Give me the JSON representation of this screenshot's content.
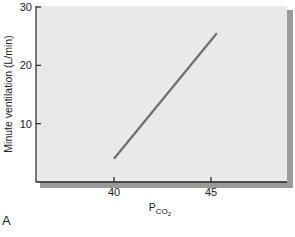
{
  "chart_data": {
    "type": "line",
    "title": "",
    "xlabel": "P_CO2",
    "xlabel_main": "P",
    "xlabel_sub": "CO",
    "xlabel_subsub": "2",
    "ylabel": "Minute ventilation (L/min)",
    "xlim": [
      37.8,
      48.7
    ],
    "ylim": [
      0,
      30
    ],
    "xticks": [
      40,
      45
    ],
    "yticks": [
      10,
      20,
      30
    ],
    "grid": false,
    "legend": null,
    "series": [
      {
        "name": "Ventilatory response to CO2",
        "color": "#6e6e6e",
        "x": [
          40,
          45.3
        ],
        "y": [
          4,
          25.5
        ]
      }
    ],
    "panel_label": "A"
  },
  "style": {
    "plot_bg": "#e9e9e9",
    "shadow": "#9a9a9a",
    "axis_color": "#222222",
    "line_color": "#6e6e6e"
  }
}
